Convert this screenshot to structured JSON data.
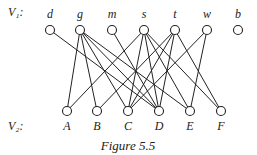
{
  "diagram": {
    "type": "bipartite-graph",
    "caption": "Figure 5.5",
    "partitions": [
      {
        "label": "V₁:",
        "id": "V1"
      },
      {
        "label": "V₂:",
        "id": "V2"
      }
    ],
    "top_nodes": [
      {
        "id": "d",
        "label": "d",
        "x": 50
      },
      {
        "id": "g",
        "label": "g",
        "x": 80
      },
      {
        "id": "m",
        "label": "m",
        "x": 112
      },
      {
        "id": "s",
        "label": "s",
        "x": 144
      },
      {
        "id": "t",
        "label": "t",
        "x": 175
      },
      {
        "id": "w",
        "label": "w",
        "x": 207
      },
      {
        "id": "b",
        "label": "b",
        "x": 238
      }
    ],
    "bottom_nodes": [
      {
        "id": "A",
        "label": "A",
        "x": 67
      },
      {
        "id": "B",
        "label": "B",
        "x": 97
      },
      {
        "id": "C",
        "label": "C",
        "x": 128
      },
      {
        "id": "D",
        "label": "D",
        "x": 159
      },
      {
        "id": "E",
        "label": "E",
        "x": 190
      },
      {
        "id": "F",
        "label": "F",
        "x": 221
      }
    ],
    "edges": [
      [
        "d",
        "D"
      ],
      [
        "g",
        "A"
      ],
      [
        "g",
        "B"
      ],
      [
        "g",
        "C"
      ],
      [
        "g",
        "D"
      ],
      [
        "g",
        "E"
      ],
      [
        "m",
        "D"
      ],
      [
        "s",
        "A"
      ],
      [
        "s",
        "C"
      ],
      [
        "s",
        "D"
      ],
      [
        "s",
        "E"
      ],
      [
        "s",
        "F"
      ],
      [
        "t",
        "B"
      ],
      [
        "t",
        "C"
      ],
      [
        "t",
        "D"
      ],
      [
        "t",
        "F"
      ],
      [
        "w",
        "C"
      ],
      [
        "w",
        "E"
      ]
    ]
  }
}
